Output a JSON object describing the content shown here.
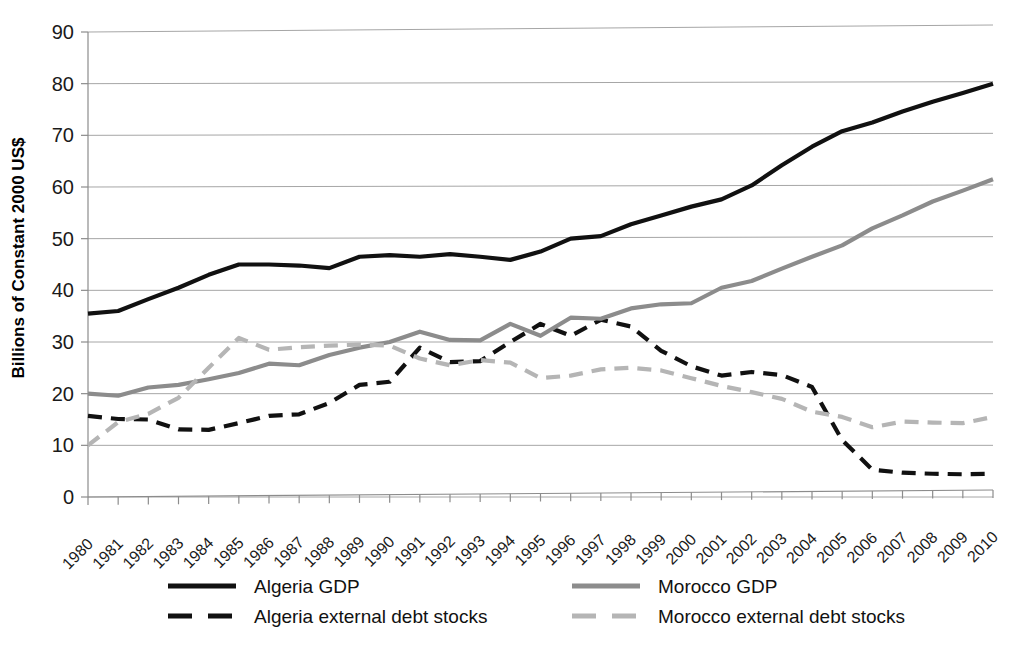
{
  "chart_data": {
    "type": "line",
    "title": "",
    "xlabel": "",
    "ylabel": "Billions of Constant 2000 US$",
    "ylim": [
      0,
      90
    ],
    "ytick_step": 10,
    "yticks": [
      "0",
      "10",
      "20",
      "30",
      "40",
      "50",
      "60",
      "70",
      "80",
      "90"
    ],
    "grid": true,
    "legend_position": "bottom",
    "x": [
      1980,
      1981,
      1982,
      1983,
      1984,
      1985,
      1986,
      1987,
      1988,
      1989,
      1990,
      1991,
      1992,
      1993,
      1994,
      1995,
      1996,
      1997,
      1998,
      1999,
      2000,
      2001,
      2002,
      2003,
      2004,
      2005,
      2006,
      2007,
      2008,
      2009,
      2010
    ],
    "categories": [
      "1980",
      "1981",
      "1982",
      "1983",
      "1984",
      "1985",
      "1986",
      "1987",
      "1988",
      "1989",
      "1990",
      "1991",
      "1992",
      "1993",
      "1994",
      "1995",
      "1996",
      "1997",
      "1998",
      "1999",
      "2000",
      "2001",
      "2002",
      "2003",
      "2004",
      "2005",
      "2006",
      "2007",
      "2008",
      "2009",
      "2010"
    ],
    "series": [
      {
        "name": "Algeria GDP",
        "color": "#111111",
        "style": "solid",
        "width": 4.2,
        "values": [
          35.5,
          36.0,
          38.3,
          40.5,
          43.0,
          45.0,
          45.0,
          44.8,
          44.3,
          46.5,
          46.8,
          46.5,
          47.0,
          46.5,
          45.9,
          47.5,
          50.0,
          50.5,
          52.8,
          54.5,
          56.2,
          57.6,
          60.3,
          64.2,
          67.8,
          70.8,
          72.5,
          74.6,
          76.5,
          78.2,
          80.0
        ]
      },
      {
        "name": "Algeria external debt stocks",
        "color": "#111111",
        "style": "dashed",
        "width": 4.2,
        "dash": "14,9",
        "values": [
          15.7,
          15.1,
          15.0,
          13.1,
          13.0,
          14.3,
          15.7,
          16.0,
          18.2,
          21.7,
          22.3,
          28.9,
          26.1,
          26.3,
          30.0,
          33.5,
          31.2,
          34.3,
          33.0,
          28.3,
          25.3,
          23.5,
          24.2,
          23.6,
          21.3,
          11.0,
          5.3,
          4.7,
          4.5,
          4.4,
          4.5
        ]
      },
      {
        "name": "Morocco GDP",
        "color": "#8c8c8c",
        "style": "solid",
        "width": 4.2,
        "values": [
          20.0,
          19.6,
          21.2,
          21.7,
          22.8,
          24.0,
          25.8,
          25.5,
          27.5,
          28.9,
          30.0,
          32.0,
          30.4,
          30.3,
          33.5,
          31.2,
          34.7,
          34.5,
          36.5,
          37.3,
          37.5,
          40.5,
          41.8,
          44.2,
          46.5,
          48.7,
          52.0,
          54.5,
          57.2,
          59.3,
          61.5
        ]
      },
      {
        "name": "Morocco external debt stocks",
        "color": "#b5b5b5",
        "style": "dashed",
        "width": 4.2,
        "dash": "14,9",
        "values": [
          10.0,
          14.5,
          16.1,
          19.2,
          25.0,
          30.8,
          28.5,
          29.0,
          29.3,
          29.5,
          29.3,
          26.8,
          25.5,
          26.5,
          26.0,
          23.0,
          23.5,
          24.7,
          25.0,
          24.5,
          23.0,
          21.5,
          20.3,
          19.0,
          16.5,
          15.5,
          13.5,
          14.6,
          14.4,
          14.3,
          15.5
        ]
      }
    ]
  },
  "legend": {
    "entries": [
      {
        "label": "Algeria GDP"
      },
      {
        "label": "Morocco GDP"
      },
      {
        "label": "Algeria external debt stocks"
      },
      {
        "label": "Morocco external debt stocks"
      }
    ]
  },
  "colors": {
    "algeria": "#111111",
    "morocco_gdp": "#8c8c8c",
    "morocco_debt": "#b5b5b5",
    "gridline": "#a6a6a6",
    "background": "#ffffff"
  }
}
